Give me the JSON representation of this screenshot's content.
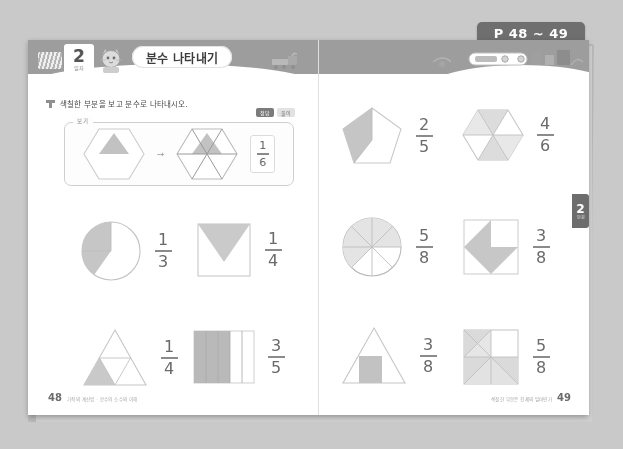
{
  "page_tab": {
    "label": "P 48 ~ 49"
  },
  "header": {
    "lesson_number": "2",
    "lesson_sub": "일차",
    "title": "분수 나타내기",
    "mascot_icon": "cat-mascot-icon",
    "train_icon": "train-illustration-icon",
    "stripes_icon": "stripes-icon"
  },
  "side_tab": {
    "number": "2",
    "sub": "단원"
  },
  "instruction": {
    "bullet_icon": "square-bullet-icon",
    "text": "색칠한 부분을 보고 분수로 나타내시오.",
    "badge_dark": "정답",
    "badge_light": "풀이"
  },
  "example": {
    "label": "보기",
    "arrow": "→",
    "fraction": {
      "numerator": "1",
      "denominator": "6"
    },
    "shape_left": "hexagon-with-shaded-triangle",
    "shape_right": "hexagon-divided-six-parts"
  },
  "left_page": {
    "page_number": "48",
    "footer_note": "기적의 계산법 · 분수와 소수의 이해",
    "problems": [
      {
        "shape": "circle-third-shaded",
        "numerator": "1",
        "denominator": "3"
      },
      {
        "shape": "square-with-triangle",
        "numerator": "1",
        "denominator": "4"
      },
      {
        "shape": "triangle-quarter-shaded",
        "numerator": "1",
        "denominator": "4"
      },
      {
        "shape": "rectangle-five-strips",
        "numerator": "3",
        "denominator": "5"
      }
    ]
  },
  "right_page": {
    "page_number": "49",
    "footer_note": "색칠한 부분은 전체의 얼마인가",
    "problems": [
      {
        "shape": "pentagon-two-fifths",
        "numerator": "2",
        "denominator": "5"
      },
      {
        "shape": "hexagon-four-sixths",
        "numerator": "4",
        "denominator": "6"
      },
      {
        "shape": "circle-eighths",
        "numerator": "5",
        "denominator": "8"
      },
      {
        "shape": "square-arrow-shape",
        "numerator": "3",
        "denominator": "8"
      },
      {
        "shape": "triangle-with-square",
        "numerator": "3",
        "denominator": "8"
      },
      {
        "shape": "square-grid-diagonals",
        "numerator": "5",
        "denominator": "8"
      }
    ]
  },
  "colors": {
    "background": "#c9c9c9",
    "page": "#ffffff",
    "band": "#9d9d9d",
    "tab": "#6f6f6f",
    "shade": "#c4c4c4",
    "stroke": "#b0b0b0",
    "text": "#4a4a4a"
  }
}
